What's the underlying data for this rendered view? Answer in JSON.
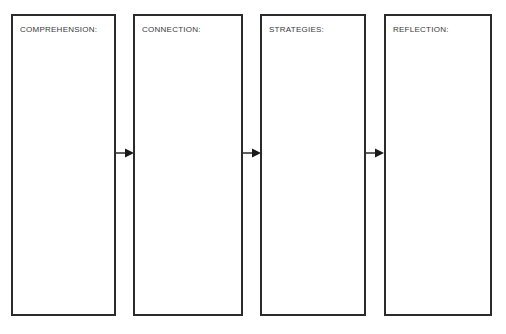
{
  "diagram": {
    "type": "linear-flow",
    "background_color": "#ffffff",
    "box_border_color": "#2b2b2b",
    "label_color": "#3a3a3a",
    "arrow_color": "#1a1a1a",
    "stages": [
      {
        "id": "comprehension",
        "label": "COMPREHENSION:",
        "content": "",
        "x": 11,
        "y": 14,
        "width": 105,
        "height": 302
      },
      {
        "id": "connection",
        "label": "CONNECTION:",
        "content": "",
        "x": 133,
        "y": 14,
        "width": 110,
        "height": 302
      },
      {
        "id": "strategies",
        "label": "STRATEGIES:",
        "content": "",
        "x": 260,
        "y": 14,
        "width": 106,
        "height": 302
      },
      {
        "id": "reflection",
        "label": "REFLECTION:",
        "content": "",
        "x": 384,
        "y": 14,
        "width": 108,
        "height": 302
      }
    ],
    "connectors": [
      {
        "id": "arrow-1",
        "from": "comprehension",
        "to": "connection",
        "x": 116,
        "y": 146,
        "width": 18
      },
      {
        "id": "arrow-2",
        "from": "connection",
        "to": "strategies",
        "x": 243,
        "y": 146,
        "width": 18
      },
      {
        "id": "arrow-3",
        "from": "strategies",
        "to": "reflection",
        "x": 366,
        "y": 146,
        "width": 18
      }
    ]
  }
}
